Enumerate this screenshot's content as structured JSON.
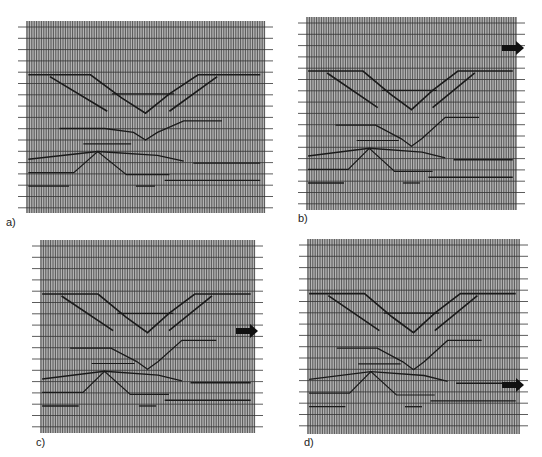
{
  "figure": {
    "panels": [
      {
        "id": "a",
        "label": "a)",
        "x": 26,
        "y": 21,
        "w": 239,
        "h": 192,
        "label_x": 6,
        "label_y": 216,
        "arrow": null,
        "stage": "unmigrated"
      },
      {
        "id": "b",
        "label": "b)",
        "x": 306,
        "y": 17,
        "w": 211,
        "h": 193,
        "label_x": 298,
        "label_y": 212,
        "arrow": {
          "x": 524,
          "y": 48
        },
        "stage": "partial"
      },
      {
        "id": "c",
        "label": "c)",
        "x": 40,
        "y": 240,
        "w": 215,
        "h": 193,
        "label_x": 36,
        "label_y": 436,
        "arrow": {
          "x": 258,
          "y": 331
        },
        "stage": "partial-deeper"
      },
      {
        "id": "d",
        "label": "d)",
        "x": 307,
        "y": 239,
        "w": 213,
        "h": 195,
        "label_x": 304,
        "label_y": 436,
        "arrow": {
          "x": 524,
          "y": 385
        },
        "stage": "migrated"
      }
    ],
    "colors": {
      "trace": "#555555",
      "background": "#9a9a9a",
      "reflector": "#1a1a1a",
      "timeline": "#333333",
      "arrow": "#111111"
    }
  }
}
